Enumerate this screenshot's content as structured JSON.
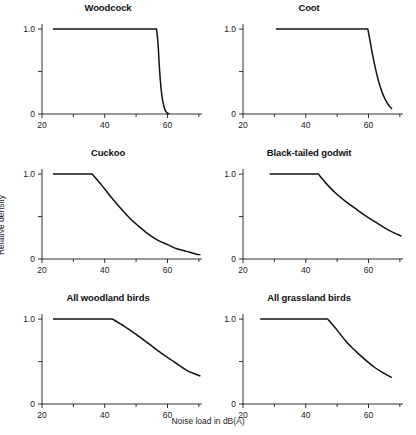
{
  "figure": {
    "xlabel": "Noise load in dB(A)",
    "ylabel": "Relative density"
  },
  "chart_data": {
    "type": "line",
    "title": "",
    "xlabel": "Noise load in dB(A)",
    "ylabel": "Relative density",
    "xlim": [
      20,
      71
    ],
    "ylim": [
      0,
      1.06
    ],
    "xticks": [
      20,
      40,
      60
    ],
    "xticklabels": [
      "20",
      "40",
      "60"
    ],
    "xminorticks": [
      30,
      50,
      70
    ],
    "yticks": [
      0,
      0.5,
      1.0
    ],
    "yticklabels": [
      "0",
      "",
      "1.0"
    ],
    "grid": false,
    "legend": "none",
    "panels": [
      {
        "title": "Woodcock",
        "row": 0,
        "col": 0,
        "threshold": 56.5,
        "x": [
          23.5,
          30,
          36,
          42,
          48,
          52,
          55,
          56.5,
          57,
          57.4,
          57.8,
          58.2,
          58.6,
          59,
          59.4,
          60,
          60.5
        ],
        "y": [
          1.0,
          1.0,
          1.0,
          1.0,
          1.0,
          1.0,
          1.0,
          1.0,
          0.82,
          0.56,
          0.36,
          0.22,
          0.13,
          0.07,
          0.035,
          0.01,
          0.0
        ]
      },
      {
        "title": "Coot",
        "row": 0,
        "col": 1,
        "threshold": 59.8,
        "x": [
          30.5,
          36,
          42,
          48,
          53,
          57,
          59.8,
          60.6,
          61.5,
          62.5,
          63.5,
          64.5,
          65.5,
          66.5,
          67.5
        ],
        "y": [
          1.0,
          1.0,
          1.0,
          1.0,
          1.0,
          1.0,
          1.0,
          0.84,
          0.66,
          0.49,
          0.35,
          0.24,
          0.16,
          0.1,
          0.06
        ]
      },
      {
        "title": "Cuckoo",
        "row": 1,
        "col": 0,
        "threshold": 36.0,
        "x": [
          23.5,
          28,
          32,
          36,
          39,
          42,
          45,
          48,
          51,
          54,
          57,
          60,
          63,
          66,
          69,
          70.5
        ],
        "y": [
          1.0,
          1.0,
          1.0,
          1.0,
          0.87,
          0.73,
          0.6,
          0.48,
          0.38,
          0.29,
          0.22,
          0.17,
          0.12,
          0.09,
          0.06,
          0.05
        ]
      },
      {
        "title": "Black-tailed godwit",
        "row": 1,
        "col": 1,
        "threshold": 44.0,
        "x": [
          28.5,
          33,
          38,
          42,
          44,
          47,
          50,
          53,
          56,
          59,
          62,
          65,
          68,
          70.5
        ],
        "y": [
          1.0,
          1.0,
          1.0,
          1.0,
          1.0,
          0.87,
          0.76,
          0.67,
          0.59,
          0.51,
          0.44,
          0.37,
          0.31,
          0.27
        ]
      },
      {
        "title": "All woodland birds",
        "row": 2,
        "col": 0,
        "threshold": 42.5,
        "x": [
          23.5,
          28,
          33,
          38,
          42.5,
          46,
          50,
          54,
          58,
          62,
          66,
          69,
          70.5
        ],
        "y": [
          1.0,
          1.0,
          1.0,
          1.0,
          1.0,
          0.92,
          0.82,
          0.71,
          0.6,
          0.5,
          0.4,
          0.35,
          0.33
        ]
      },
      {
        "title": "All grassland birds",
        "row": 2,
        "col": 1,
        "threshold": 47.0,
        "x": [
          25.5,
          30,
          35,
          40,
          44,
          47,
          50,
          53,
          56,
          59,
          62,
          65,
          67.5
        ],
        "y": [
          1.0,
          1.0,
          1.0,
          1.0,
          1.0,
          1.0,
          0.87,
          0.73,
          0.62,
          0.52,
          0.43,
          0.36,
          0.31
        ]
      }
    ]
  }
}
